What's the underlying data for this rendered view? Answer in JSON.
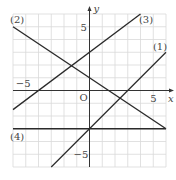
{
  "chart_data": {
    "type": "line",
    "title": "",
    "xlabel": "x",
    "ylabel": "y",
    "origin_label": "O",
    "xlim": [
      -6,
      6
    ],
    "ylim": [
      -6,
      6
    ],
    "grid": true,
    "grid_step": 1,
    "x_tick_labels": [
      {
        "value": -5,
        "label": "−5"
      },
      {
        "value": 5,
        "label": "5"
      }
    ],
    "y_tick_labels": [
      {
        "value": 5,
        "label": "5"
      },
      {
        "value": -5,
        "label": "−5"
      }
    ],
    "series": [
      {
        "name": "(1)",
        "equation": "y = x - 3",
        "slope": 1,
        "intercept": -3,
        "x_range": [
          -3,
          6
        ]
      },
      {
        "name": "(2)",
        "equation": "y = -2/3 x + 1",
        "slope": -0.6667,
        "intercept": 1,
        "x_range": [
          -6,
          6
        ]
      },
      {
        "name": "(3)",
        "equation": "y = 3/4 x + 3",
        "slope": 0.75,
        "intercept": 3,
        "x_range": [
          -6,
          4
        ]
      },
      {
        "name": "(4)",
        "equation": "y = -3",
        "slope": 0,
        "intercept": -3,
        "x_range": [
          -6,
          6
        ]
      }
    ],
    "line_labels": [
      {
        "text": "(1)",
        "x": 5.6,
        "y": 3.5
      },
      {
        "text": "(2)",
        "x": -5.6,
        "y": 5.6
      },
      {
        "text": "(3)",
        "x": 4.5,
        "y": 5.6
      },
      {
        "text": "(4)",
        "x": -5.6,
        "y": -3.6
      }
    ],
    "colors": {
      "grid": "#d9d9d9",
      "axis": "#333333",
      "line": "#2a2a2a"
    }
  }
}
